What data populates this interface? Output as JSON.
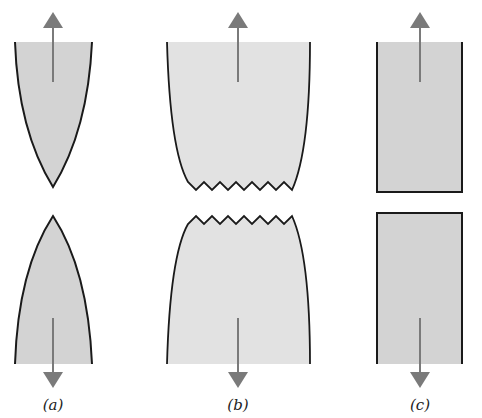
{
  "figure": {
    "panels": [
      {
        "id": "a",
        "label": "(a)",
        "description": "ductile cup-and-cone type: fully necked to a point"
      },
      {
        "id": "b",
        "label": "(b)",
        "description": "moderately ductile fracture after necking with jagged surface"
      },
      {
        "id": "c",
        "label": "(c)",
        "description": "brittle fracture without plastic deformation"
      }
    ],
    "colors": {
      "fill": "#d3d3d3",
      "fill_light": "#e2e2e2",
      "outline": "#1a1a1a",
      "arrow": "#7a7a7a"
    }
  }
}
